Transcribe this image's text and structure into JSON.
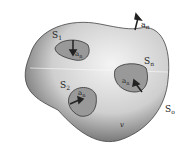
{
  "diagram": {
    "outer_surface_label": "S",
    "outer_surface_sub": "o",
    "volume_label": "v",
    "normal_label": "a",
    "normal_sub": "n",
    "inner_surfaces": [
      {
        "label": "S",
        "sub": "1"
      },
      {
        "label": "S",
        "sub": "2"
      },
      {
        "label": "S",
        "sub": "n"
      }
    ]
  }
}
